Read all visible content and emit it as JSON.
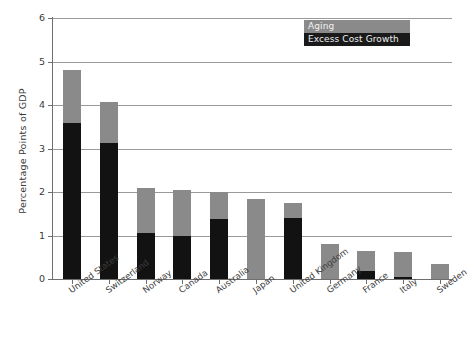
{
  "chart_data": {
    "type": "bar",
    "stacked": true,
    "title": "",
    "xlabel": "",
    "ylabel": "Percentage Points of GDP",
    "ylim": [
      0,
      6
    ],
    "yticks": [
      0,
      1,
      2,
      3,
      4,
      5,
      6
    ],
    "ytick_labels": [
      "0",
      "1",
      "2",
      "3",
      "4",
      "5",
      "6"
    ],
    "grid": true,
    "legend_position": "top-right",
    "categories": [
      "United States",
      "Switzerland",
      "Norway",
      "Canada",
      "Australia",
      "Japan",
      "United Kingdom",
      "Germany",
      "France",
      "Italy",
      "Sweden"
    ],
    "series": [
      {
        "name": "Excess Cost Growth",
        "color": "#121212",
        "values": [
          3.58,
          3.12,
          1.05,
          1.0,
          1.38,
          0.0,
          1.4,
          0.0,
          0.18,
          0.05,
          0.0
        ]
      },
      {
        "name": "Aging",
        "color": "#8a8a8a",
        "values": [
          1.22,
          0.95,
          1.05,
          1.05,
          0.62,
          1.85,
          0.35,
          0.8,
          0.47,
          0.57,
          0.35
        ]
      }
    ],
    "totals": [
      4.8,
      4.07,
      2.1,
      2.05,
      2.0,
      1.85,
      1.75,
      0.8,
      0.65,
      0.62,
      0.35
    ]
  },
  "legend": {
    "items": [
      {
        "label": "Aging",
        "color": "#8a8a8a"
      },
      {
        "label": "Excess Cost Growth",
        "color": "#1a1a1a"
      }
    ]
  },
  "axes": {
    "y_title": "Percentage Points of GDP"
  }
}
